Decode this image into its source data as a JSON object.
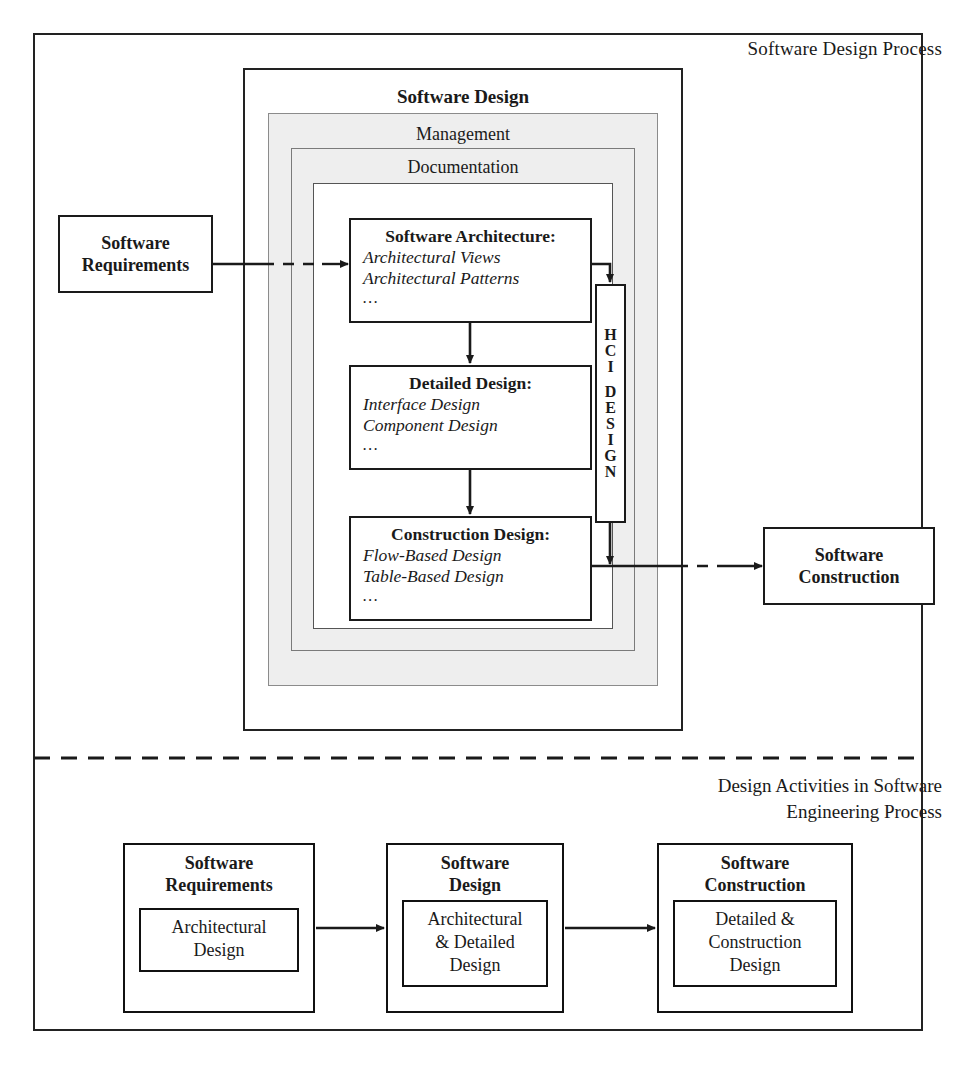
{
  "diagram": {
    "outer_label": "Software Design Process",
    "software_design": {
      "title": "Software Design",
      "management_label": "Management",
      "documentation_label": "Documentation"
    },
    "phases": [
      {
        "title": "Software Architecture:",
        "items": [
          "Architectural Views",
          "Architectural Patterns"
        ],
        "ellipsis": "..."
      },
      {
        "title": "Detailed Design:",
        "items": [
          "Interface Design",
          "Component Design"
        ],
        "ellipsis": "..."
      },
      {
        "title": "Construction Design:",
        "items": [
          "Flow-Based Design",
          "Table-Based Design"
        ],
        "ellipsis": "..."
      }
    ],
    "hci": {
      "label": "HCI DESIGN",
      "letters": [
        "H",
        "C",
        "I",
        "",
        "D",
        "E",
        "S",
        "I",
        "G",
        "N"
      ]
    },
    "inputs": {
      "requirements_line1": "Software",
      "requirements_line2": "Requirements"
    },
    "outputs": {
      "construction_line1": "Software",
      "construction_line2": "Construction"
    },
    "bottom": {
      "caption_line1": "Design Activities in Software",
      "caption_line2": "Engineering Process",
      "boxes": [
        {
          "title_line1": "Software",
          "title_line2": "Requirements",
          "inner_line1": "Architectural",
          "inner_line2": "Design",
          "inner_line3": ""
        },
        {
          "title_line1": "Software",
          "title_line2": "Design",
          "inner_line1": "Architectural",
          "inner_line2": "& Detailed",
          "inner_line3": "Design"
        },
        {
          "title_line1": "Software",
          "title_line2": "Construction",
          "inner_line1": "Detailed &",
          "inner_line2": "Construction",
          "inner_line3": "Design"
        }
      ]
    },
    "colors": {
      "stroke": "#1a1a1a",
      "shade": "#eeeeee",
      "background": "#ffffff"
    }
  }
}
